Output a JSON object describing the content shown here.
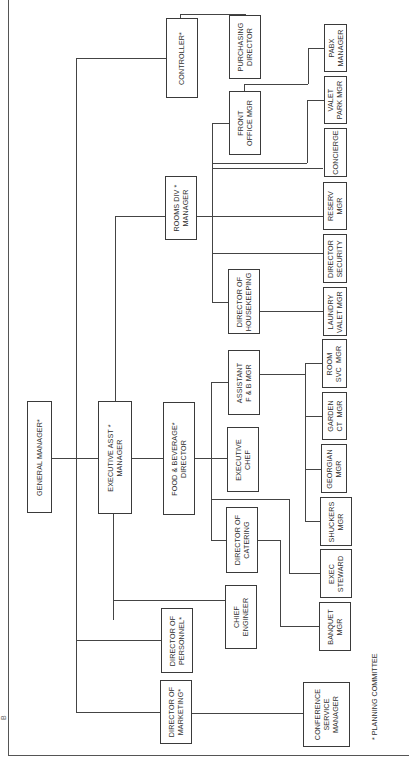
{
  "chart": {
    "orientation": "rotated 90 degrees counter-clockwise",
    "title_fragment": "B",
    "footnote": "* PLANNING COMMITTEE",
    "nodes": {
      "general_manager": "GENERAL MANAGER*",
      "executive_asst_manager": "EXECUTIVE ASST *\nMANAGER",
      "director_of_marketing": "DIRECTOR OF\nMARKETING*",
      "director_of_personnel": "DIRECTOR OF\nPERSONNEL*",
      "controller": "CONTROLLER*",
      "purchasing_director": "PURCHASING\nDIRECTOR",
      "food_beverage_director": "FOOD & BEVERAGE*\nDIRECTOR",
      "rooms_div_manager": "ROOMS DIV *\nMANAGER",
      "chief_engineer": "CHIEF\nENGINEER",
      "director_of_catering": "DIRECTOR OF\nCATERING",
      "executive_chef": "EXECUTIVE\nCHEF",
      "assistant_fb_mgr": "ASSISTANT\nF & B MGR",
      "director_of_housekeeping": "DIRECTOR OF\nHOUSEKEEPING",
      "front_office_mgr": "FRONT\nOFFICE MGR",
      "conference_service_manager": "CONFERENCE\nSERVICE\nMANAGER",
      "banquet_mgr": "BANQUET\nMGR",
      "exec_steward": "EXEC\nSTEWARD",
      "shuckers_mgr": "SHUCKERS\nMGR",
      "georgian_mgr": "GEORGIAN\nMGR",
      "garden_ct_mgr": "GARDEN\nCT  MGR",
      "room_svc_mgr": "ROOM\nSVC  MGR",
      "laundry_valet_mgr": "LAUNDRY\nVALET MGR",
      "director_security": "DIRECTOR\nSECURITY",
      "reserv_mgr": "RESERV\nMGR",
      "concierge": "CONCIERGE",
      "valet_park_mgr": "VALET\nPARK MGR",
      "pabx_manager": "PABX\nMANAGER"
    }
  }
}
